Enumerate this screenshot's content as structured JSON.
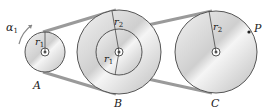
{
  "diagram": {
    "type": "belt-pulley-system",
    "pulleys": [
      {
        "id": "A",
        "label": "A",
        "radius_label": "r",
        "radius_sub": "1",
        "cx": 45,
        "cy": 52,
        "r": 20
      },
      {
        "id": "B",
        "label": "B",
        "outer_radius_label": "r",
        "outer_radius_sub": "2",
        "inner_radius_label": "r",
        "inner_radius_sub": "1",
        "cx": 119,
        "cy": 52,
        "r_outer": 42,
        "r_inner": 23
      },
      {
        "id": "C",
        "label": "C",
        "radius_label": "r",
        "radius_sub": "2",
        "cx": 216,
        "cy": 52,
        "r": 41
      }
    ],
    "annotations": {
      "alpha": "α",
      "alpha_sub": "1",
      "point": "P"
    },
    "colors": {
      "disk_light": "#e4e4e4",
      "disk_dark": "#b8b8b8",
      "belt": "#9a9a9a",
      "outline": "#555555"
    }
  }
}
